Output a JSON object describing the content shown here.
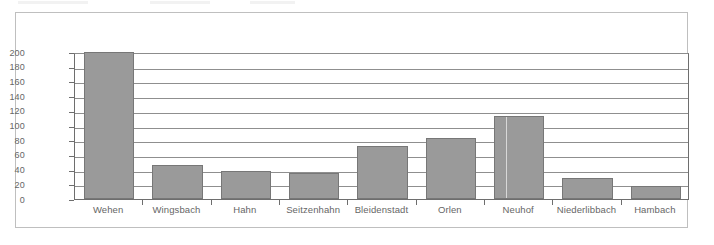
{
  "chart_data": {
    "type": "bar",
    "title": "",
    "subtitle": "",
    "xlabel": "",
    "ylabel": "",
    "categories": [
      "Wehen",
      "Wingsbach",
      "Hahn",
      "Seitzenhahn",
      "Bleidenstadt",
      "Orlen",
      "Neuhof",
      "Niederlibbach",
      "Hambach"
    ],
    "values": [
      200,
      47,
      38,
      36,
      72,
      83,
      113,
      28,
      18
    ],
    "ylim": [
      0,
      200
    ],
    "yticks": [
      0,
      20,
      40,
      60,
      80,
      100,
      120,
      140,
      160,
      180,
      200
    ],
    "ytick_labels": [
      "0",
      "20",
      "40",
      "60",
      "80",
      "100",
      "120",
      "140",
      "160",
      "180",
      "200"
    ],
    "grid": true,
    "grid_axis": "y",
    "legend": false,
    "legend_position": "none",
    "annotations": [],
    "bar_color": "#9a9a9a",
    "bar_edge_color": "#777777",
    "grid_color": "#8f8f8f",
    "axis_color": "#6e6e6e",
    "tick_label_color": "#666666",
    "frame_color": "#bfbfbf",
    "background_color": "#ffffff"
  }
}
